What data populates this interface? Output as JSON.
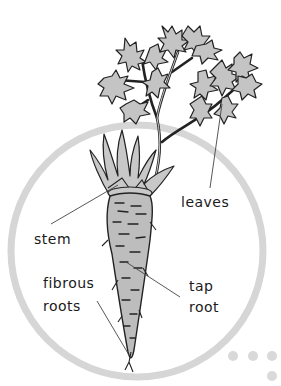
{
  "diagram": {
    "labels": {
      "leaves": "leaves",
      "stem": "stem",
      "fibrous_roots_line1": "fibrous",
      "fibrous_roots_line2": "roots",
      "tap_root_line1": "tap",
      "tap_root_line2": "root"
    },
    "colors": {
      "background_circle": "#d6d6d6",
      "plant_fill": "#c4c4c4",
      "outline": "#222222",
      "dots": "#d9d9d9"
    },
    "decoration": {
      "dots_count": 4
    }
  }
}
